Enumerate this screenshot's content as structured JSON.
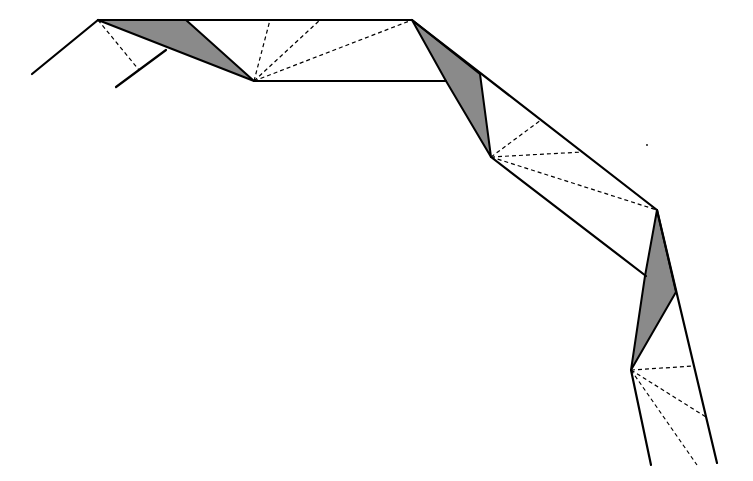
{
  "diagram": {
    "colors": {
      "background": "#ffffff",
      "line": "#000000",
      "shade": "#8a8a8a"
    },
    "shaded_regions": [
      {
        "name": "fold-1",
        "points": "98,20 186,20 254,81"
      },
      {
        "name": "fold-2",
        "points": "412,20 480,74 491,157 446,81"
      },
      {
        "name": "fold-3",
        "points": "657,210 676,292 631,370 645,276"
      }
    ],
    "solid_lines": [
      {
        "name": "left-outer-leg",
        "x1": 32,
        "y1": 74,
        "x2": 98,
        "y2": 20
      },
      {
        "name": "left-inner-leg",
        "x1": 116,
        "y1": 87,
        "x2": 166,
        "y2": 50
      },
      {
        "name": "top-edge",
        "x1": 98,
        "y1": 20,
        "x2": 412,
        "y2": 20
      },
      {
        "name": "upper-bottom-edge",
        "x1": 254,
        "y1": 81,
        "x2": 446,
        "y2": 81
      },
      {
        "name": "right-outer-diagonal",
        "x1": 412,
        "y1": 20,
        "x2": 657,
        "y2": 210
      },
      {
        "name": "middle-inner-diagonal",
        "x1": 491,
        "y1": 157,
        "x2": 646,
        "y2": 276
      },
      {
        "name": "lower-outer-edge",
        "x1": 657,
        "y1": 210,
        "x2": 717,
        "y2": 463
      },
      {
        "name": "lower-inner-edge",
        "x1": 631,
        "y1": 370,
        "x2": 651,
        "y2": 465
      }
    ],
    "dashed_lines": [
      {
        "name": "apex-crease",
        "x1": 98,
        "y1": 20,
        "x2": 139,
        "y2": 70
      },
      {
        "name": "fan-1a",
        "x1": 254,
        "y1": 81,
        "x2": 270,
        "y2": 20
      },
      {
        "name": "fan-1b",
        "x1": 254,
        "y1": 81,
        "x2": 320,
        "y2": 20
      },
      {
        "name": "fan-1c",
        "x1": 254,
        "y1": 81,
        "x2": 412,
        "y2": 20
      },
      {
        "name": "fan-2a",
        "x1": 491,
        "y1": 157,
        "x2": 541,
        "y2": 120
      },
      {
        "name": "fan-2b",
        "x1": 491,
        "y1": 157,
        "x2": 583,
        "y2": 152
      },
      {
        "name": "fan-2c",
        "x1": 491,
        "y1": 157,
        "x2": 657,
        "y2": 210
      },
      {
        "name": "fan-3a",
        "x1": 631,
        "y1": 370,
        "x2": 694,
        "y2": 366
      },
      {
        "name": "fan-3b",
        "x1": 631,
        "y1": 370,
        "x2": 706,
        "y2": 417
      },
      {
        "name": "fan-3c",
        "x1": 631,
        "y1": 370,
        "x2": 697,
        "y2": 465
      }
    ],
    "stray_dot": {
      "cx": 647,
      "cy": 145,
      "r": 0.9
    }
  }
}
